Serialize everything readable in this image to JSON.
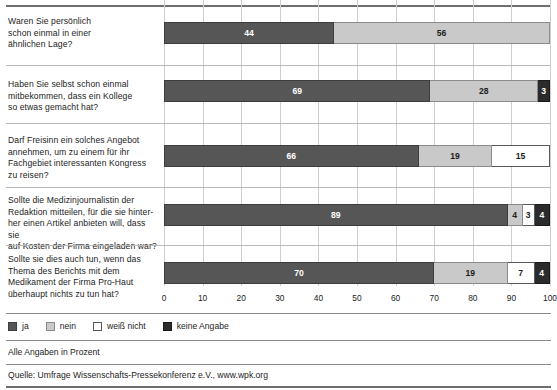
{
  "chart_data": {
    "type": "bar",
    "subtype": "stacked-horizontal-100",
    "title": "",
    "xlabel": "",
    "ylabel": "",
    "xlim": [
      0,
      100
    ],
    "xticks": [
      "0",
      "10",
      "20",
      "30",
      "40",
      "50",
      "60",
      "70",
      "80",
      "90",
      "100"
    ],
    "grid": true,
    "legend_position": "bottom-left",
    "legend": [
      "ja",
      "nein",
      "weiß nicht",
      "keine Angabe"
    ],
    "categories": [
      "Waren Sie persönlich schon einmal in einer ähnlichen Lage?",
      "Haben Sie selbst schon einmal mitbekommen, dass ein Kollege so etwas gemacht hat?",
      "Darf Freisinn ein solches Angebot annehmen, um zu einem für ihr Fachgebiet interessanten Kongress zu reisen?",
      "Sollte die Medizinjournalistin der Redaktion mitteilen, für die sie hinterher einen Artikel anbieten will, dass sie auf Kosten der Firma eingeladen war?",
      "Sollte sie dies auch tun, wenn das Thema des Berichts mit dem Medikament der Firma Pro-Haut überhaupt nichts zu tun hat?"
    ],
    "series": [
      {
        "name": "ja",
        "key": "ja",
        "color": "#565656",
        "values": [
          44,
          69,
          66,
          89,
          70
        ]
      },
      {
        "name": "nein",
        "key": "nein",
        "color": "#c9c9c9",
        "values": [
          56,
          28,
          19,
          4,
          19
        ]
      },
      {
        "name": "weiß nicht",
        "key": "weissnicht",
        "color": "#ffffff",
        "values": [
          0,
          0,
          15,
          3,
          7
        ]
      },
      {
        "name": "keine Angabe",
        "key": "keine",
        "color": "#2b2b2b",
        "values": [
          0,
          3,
          0,
          4,
          4
        ]
      }
    ],
    "annotations": [
      "Alle Angaben in Prozent"
    ],
    "source": "Quelle: Umfrage Wissenschafts-Pressekonferenz e.V., www.wpk.org"
  },
  "rows": [
    {
      "question": "Waren Sie persönlich\nschon einmal in einer\nähnlichen Lage?",
      "segments": [
        {
          "key": "ja",
          "label": "44",
          "value": 44
        },
        {
          "key": "nein",
          "label": "56",
          "value": 56
        }
      ]
    },
    {
      "question": "Haben Sie selbst schon einmal\nmitbekommen, dass ein Kollege\nso etwas gemacht hat?",
      "segments": [
        {
          "key": "ja",
          "label": "69",
          "value": 69
        },
        {
          "key": "nein",
          "label": "28",
          "value": 28
        },
        {
          "key": "keine",
          "label": "3",
          "value": 3
        }
      ]
    },
    {
      "question": "Darf Freisinn ein solches Angebot\nannehmen, um zu einem für ihr\nFachgebiet interessanten Kongress\nzu reisen?",
      "segments": [
        {
          "key": "ja",
          "label": "66",
          "value": 66
        },
        {
          "key": "nein",
          "label": "19",
          "value": 19
        },
        {
          "key": "weissnicht",
          "label": "15",
          "value": 15
        }
      ]
    },
    {
      "question": "Sollte die Medizinjournalistin der\nRedaktion mitteilen, für die sie hinter-\nher einen Artikel anbieten will, dass sie\nauf Kosten der Firma eingeladen war?",
      "segments": [
        {
          "key": "ja",
          "label": "89",
          "value": 89
        },
        {
          "key": "nein",
          "label": "4",
          "value": 4
        },
        {
          "key": "weissnicht",
          "label": "3",
          "value": 3
        },
        {
          "key": "keine",
          "label": "4",
          "value": 4
        }
      ]
    },
    {
      "question": "Sollte sie dies auch tun, wenn das\nThema des Berichts mit dem\nMedikament der Firma Pro-Haut\nüberhaupt nichts zu tun hat?",
      "segments": [
        {
          "key": "ja",
          "label": "70",
          "value": 70
        },
        {
          "key": "nein",
          "label": "19",
          "value": 19
        },
        {
          "key": "weissnicht",
          "label": "7",
          "value": 7
        },
        {
          "key": "keine",
          "label": "4",
          "value": 4
        }
      ]
    }
  ],
  "axis": {
    "ticks": [
      "0",
      "10",
      "20",
      "30",
      "40",
      "50",
      "60",
      "70",
      "80",
      "90",
      "100"
    ]
  },
  "legend": {
    "items": [
      {
        "key": "ja",
        "label": "ja"
      },
      {
        "key": "nein",
        "label": "nein"
      },
      {
        "key": "weissnicht",
        "label": "weiß nicht"
      },
      {
        "key": "keine",
        "label": "keine Angabe"
      }
    ]
  },
  "footer": {
    "unit_note": "Alle Angaben in Prozent",
    "source": "Quelle: Umfrage Wissenschafts-Pressekonferenz e.V., www.wpk.org"
  }
}
